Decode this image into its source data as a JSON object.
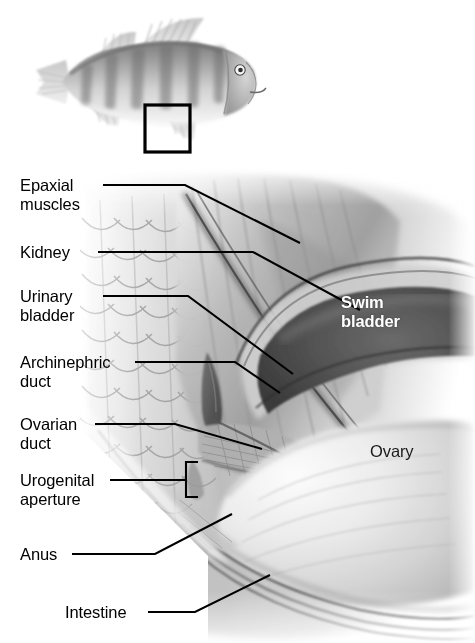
{
  "thumbnail": {
    "name": "whole-fish-perch",
    "inset_box": {
      "x": 145,
      "y": 105,
      "width": 45,
      "height": 47,
      "stroke": "#000000"
    }
  },
  "callout_labels": [
    {
      "id": "epaxial-muscles",
      "text": "Epaxial\nmuscles",
      "x": 20,
      "y": 178
    },
    {
      "id": "kidney",
      "text": "Kidney",
      "x": 20,
      "y": 245
    },
    {
      "id": "urinary-bladder",
      "text": "Urinary\nbladder",
      "x": 20,
      "y": 288
    },
    {
      "id": "archinephric-duct",
      "text": "Archinephric\nduct",
      "x": 20,
      "y": 355
    },
    {
      "id": "ovarian-duct",
      "text": "Ovarian\nduct",
      "x": 20,
      "y": 417
    },
    {
      "id": "urogenital-aperture",
      "text": "Urogenital\naperture",
      "x": 20,
      "y": 473
    },
    {
      "id": "anus",
      "text": "Anus",
      "x": 20,
      "y": 547
    },
    {
      "id": "intestine",
      "text": "Intestine",
      "x": 65,
      "y": 605
    }
  ],
  "interior_labels": [
    {
      "id": "swim-bladder",
      "text": "Swim\nbladder",
      "x": 341,
      "y": 296,
      "color": "#ffffff",
      "bold": true
    },
    {
      "id": "ovary",
      "text": "Ovary",
      "x": 370,
      "y": 444,
      "color": "#1a1a1a",
      "bold": false
    }
  ],
  "leader_lines": [
    {
      "id": "leader-epaxial-muscles",
      "points": "103,185 185,185 300,243"
    },
    {
      "id": "leader-kidney",
      "points": "98,252 253,252 360,310"
    },
    {
      "id": "leader-urinary-bladder",
      "points": "103,296 188,296 293,374"
    },
    {
      "id": "leader-archinephric-duct",
      "points": "135,362 235,362 280,393"
    },
    {
      "id": "leader-ovarian-duct",
      "points": "95,424 175,424 262,449"
    },
    {
      "id": "leader-urogenital-aperture",
      "points": "110,480 185,480"
    },
    {
      "id": "leader-anus",
      "points": "72,554 155,554 232,514"
    },
    {
      "id": "leader-intestine",
      "points": "148,612 195,612 270,575"
    }
  ],
  "urogenital_bracket": {
    "id": "urogenital-bracket",
    "points": "198,462 186,462 186,497 198,497"
  },
  "palette": {
    "ink": "#000000",
    "tissue_light": "#dcdcdc",
    "tissue_mid": "#a8a8a8",
    "tissue_dark": "#5a5a5a",
    "swim_bladder_dark": "#4a4a4a",
    "background": "#ffffff"
  }
}
